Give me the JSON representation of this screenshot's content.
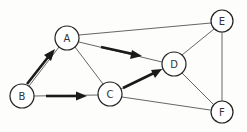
{
  "diagram": {
    "type": "graph",
    "nodes": [
      {
        "id": "A",
        "label": "A",
        "x": 67,
        "y": 38
      },
      {
        "id": "B",
        "label": "B",
        "x": 22,
        "y": 96
      },
      {
        "id": "C",
        "label": "C",
        "x": 110,
        "y": 94
      },
      {
        "id": "D",
        "label": "D",
        "x": 174,
        "y": 64
      },
      {
        "id": "E",
        "label": "E",
        "x": 222,
        "y": 21
      },
      {
        "id": "F",
        "label": "F",
        "x": 222,
        "y": 112
      }
    ],
    "edges": [
      {
        "from": "A",
        "to": "E",
        "directed": false
      },
      {
        "from": "A",
        "to": "D",
        "directed": true
      },
      {
        "from": "A",
        "to": "C",
        "directed": false
      },
      {
        "from": "B",
        "to": "A",
        "directed": true
      },
      {
        "from": "B",
        "to": "C",
        "directed": true
      },
      {
        "from": "C",
        "to": "D",
        "directed": true
      },
      {
        "from": "C",
        "to": "F",
        "directed": false
      },
      {
        "from": "D",
        "to": "E",
        "directed": false
      },
      {
        "from": "D",
        "to": "F",
        "directed": false
      },
      {
        "from": "E",
        "to": "F",
        "directed": false
      }
    ],
    "colors": {
      "background": "#fdfdfc",
      "edge": "#555555",
      "arrow": "#1a1a1a",
      "node_stroke": "#222222"
    }
  }
}
